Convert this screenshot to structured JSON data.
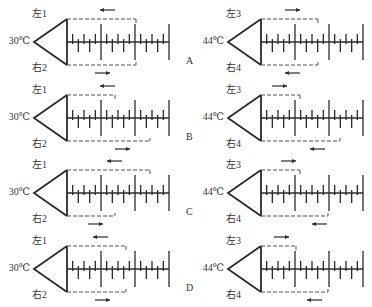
{
  "diagram": {
    "colors": {
      "stroke": "#2a2a2a",
      "dash": "#555555",
      "text": "#333333"
    },
    "ruler": {
      "intervals": 18,
      "major_every": 6
    },
    "options": [
      {
        "letter": "A",
        "y": 0,
        "left": {
          "temp": "30℃",
          "top_label": "左1",
          "bottom_label": "右2",
          "top_dash_end": 136,
          "top_arrow": "left",
          "top_arrow_x": 100,
          "bottom_dash_end": 136,
          "bottom_arrow": "right",
          "bottom_arrow_x": 95
        },
        "right": {
          "temp": "44℃",
          "top_label": "左3",
          "bottom_label": "右4",
          "top_dash_end": 318,
          "top_arrow": "right",
          "top_arrow_x": 285,
          "bottom_dash_end": 318,
          "bottom_arrow": "left",
          "bottom_arrow_x": 285
        }
      },
      {
        "letter": "B",
        "y": 76,
        "left": {
          "temp": "30℃",
          "top_label": "左1",
          "bottom_label": "右2",
          "top_dash_end": 115,
          "top_arrow": "left",
          "top_arrow_x": 100,
          "bottom_dash_end": 150,
          "bottom_arrow": "right",
          "bottom_arrow_x": 115
        },
        "right": {
          "temp": "44℃",
          "top_label": "左3",
          "bottom_label": "右4",
          "top_dash_end": 300,
          "top_arrow": "right",
          "top_arrow_x": 272,
          "bottom_dash_end": 340,
          "bottom_arrow": "left",
          "bottom_arrow_x": 310
        }
      },
      {
        "letter": "C",
        "y": 151,
        "left": {
          "temp": "30℃",
          "top_label": "左1",
          "bottom_label": "右2",
          "top_dash_end": 150,
          "top_arrow": "left",
          "top_arrow_x": 107,
          "bottom_dash_end": 115,
          "bottom_arrow": "right",
          "bottom_arrow_x": 88
        },
        "right": {
          "temp": "44℃",
          "top_label": "左3",
          "bottom_label": "右4",
          "top_dash_end": 300,
          "top_arrow": "right",
          "top_arrow_x": 281,
          "bottom_dash_end": 328,
          "bottom_arrow": "left",
          "bottom_arrow_x": 312
        }
      },
      {
        "letter": "D",
        "y": 227,
        "left": {
          "temp": "30℃",
          "top_label": "左1",
          "bottom_label": "右2",
          "top_dash_end": 126,
          "top_arrow": "left",
          "top_arrow_x": 93,
          "bottom_dash_end": 126,
          "bottom_arrow": "right",
          "bottom_arrow_x": 95
        },
        "right": {
          "temp": "44℃",
          "top_label": "左3",
          "bottom_label": "右4",
          "top_dash_end": 296,
          "top_arrow": "right",
          "top_arrow_x": 274,
          "bottom_dash_end": 328,
          "bottom_arrow": "left",
          "bottom_arrow_x": 307
        }
      }
    ]
  }
}
